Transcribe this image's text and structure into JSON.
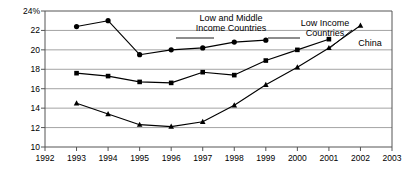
{
  "chart_data": {
    "type": "line",
    "title": "",
    "subtitle": "",
    "xlabel": "",
    "ylabel": "",
    "xlim": [
      1992,
      2003
    ],
    "ylim": [
      10,
      24
    ],
    "ytick_step": 2,
    "grid": true,
    "grid_axis": "y",
    "legend_position": "inline-annotations",
    "axis_tick_labels": {
      "y": [
        "10",
        "12",
        "14",
        "16",
        "18",
        "20",
        "22",
        "24%"
      ],
      "x": [
        "1992",
        "1993",
        "1994",
        "1995",
        "1996",
        "1997",
        "1998",
        "1999",
        "2000",
        "2001",
        "2002",
        "2003"
      ]
    },
    "series": [
      {
        "name": "Low and Middle Income Countries",
        "marker": "circle",
        "color": "#000000",
        "label_lines": [
          "Low and Middle",
          "Income Countries"
        ],
        "x": [
          1993,
          1994,
          1995,
          1996,
          1997,
          1998,
          1999
        ],
        "values": [
          22.4,
          23.0,
          19.5,
          20.0,
          20.2,
          20.8,
          21.0
        ]
      },
      {
        "name": "Low Income Countries",
        "marker": "square",
        "color": "#000000",
        "label_lines": [
          "Low Income",
          "Countries"
        ],
        "x": [
          1993,
          1994,
          1995,
          1996,
          1997,
          1998,
          1999,
          2000,
          2001
        ],
        "values": [
          17.6,
          17.3,
          16.7,
          16.6,
          17.7,
          17.4,
          18.9,
          20.0,
          21.1
        ]
      },
      {
        "name": "China",
        "marker": "triangle",
        "color": "#000000",
        "label_lines": [
          "China"
        ],
        "x": [
          1993,
          1994,
          1995,
          1996,
          1997,
          1998,
          1999,
          2000,
          2001,
          2002
        ],
        "values": [
          14.5,
          13.4,
          12.3,
          12.1,
          12.6,
          14.3,
          16.4,
          18.2,
          20.2,
          22.5
        ]
      }
    ],
    "annotations": [
      {
        "id": "ann-low-middle",
        "text": "Low and Middle Income Countries"
      },
      {
        "id": "ann-low-income",
        "text": "Low Income Countries"
      },
      {
        "id": "ann-china",
        "text": "China"
      }
    ]
  }
}
